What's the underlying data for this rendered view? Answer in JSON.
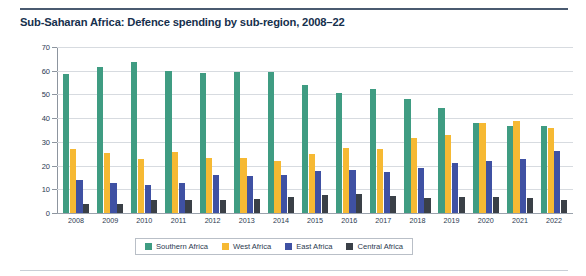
{
  "figure": {
    "title": "Sub-Saharan Africa: Defence spending by sub-region, 2008–22"
  },
  "chart_data": {
    "type": "bar",
    "title": "Sub-Saharan Africa: Defence spending by sub-region, 2008–22",
    "xlabel": "",
    "ylabel": "% share of total",
    "ylim": [
      0,
      70
    ],
    "yticks": [
      0,
      10,
      20,
      30,
      40,
      50,
      60,
      70
    ],
    "grid": true,
    "legend_position": "bottom",
    "categories": [
      "2008",
      "2009",
      "2010",
      "2011",
      "2012",
      "2013",
      "2014",
      "2015",
      "2016",
      "2017",
      "2018",
      "2019",
      "2020",
      "2021",
      "2022"
    ],
    "series": [
      {
        "name": "Southern Africa",
        "color": "#3f9c82",
        "values": [
          58.5,
          61.5,
          63.5,
          59.8,
          59.2,
          59.3,
          59.3,
          54.0,
          50.4,
          52.4,
          48.0,
          44.2,
          37.8,
          36.5,
          36.8
        ]
      },
      {
        "name": "West Africa",
        "color": "#f6b933",
        "values": [
          27.0,
          25.3,
          22.9,
          25.6,
          23.2,
          23.4,
          22.1,
          25.0,
          27.3,
          27.0,
          31.6,
          33.0,
          37.9,
          38.9,
          35.8
        ]
      },
      {
        "name": "East Africa",
        "color": "#3f51a3",
        "values": [
          14.0,
          12.8,
          11.9,
          12.6,
          16.2,
          15.4,
          15.9,
          17.9,
          18.3,
          17.4,
          19.1,
          21.0,
          22.1,
          22.6,
          26.3
        ]
      },
      {
        "name": "Central Africa",
        "color": "#3a4047",
        "values": [
          3.7,
          3.8,
          5.4,
          5.6,
          5.3,
          6.1,
          6.8,
          7.5,
          8.2,
          7.1,
          6.2,
          6.7,
          6.8,
          6.4,
          5.6
        ]
      }
    ]
  },
  "legend": {
    "items": [
      {
        "label": "Southern Africa",
        "color": "#3f9c82"
      },
      {
        "label": "West Africa",
        "color": "#f6b933"
      },
      {
        "label": "East Africa",
        "color": "#3f51a3"
      },
      {
        "label": "Central Africa",
        "color": "#3a4047"
      }
    ]
  }
}
